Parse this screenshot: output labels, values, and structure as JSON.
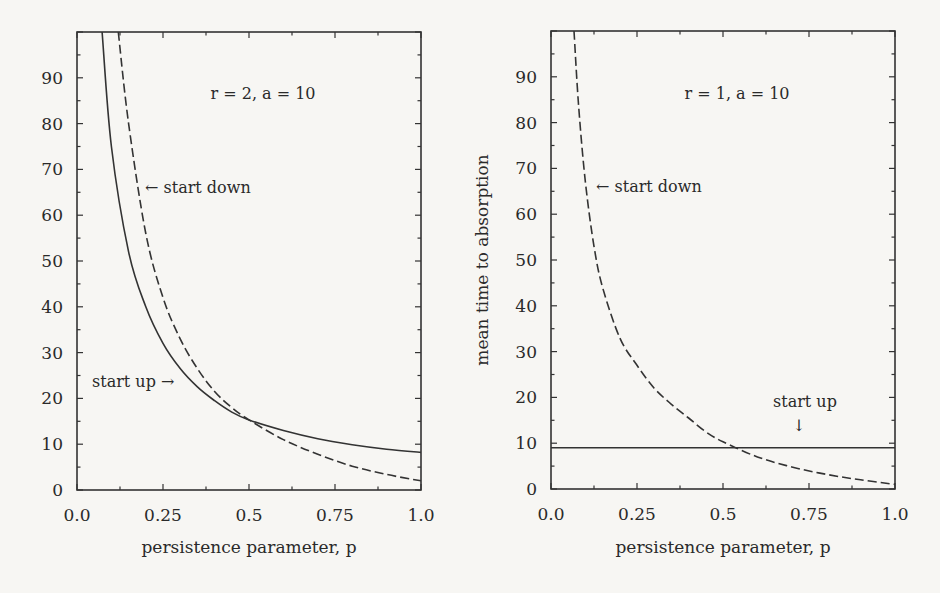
{
  "chart_data": [
    {
      "type": "line",
      "title": "r = 2, a = 10",
      "xlabel": "persistence parameter, p",
      "ylabel": "",
      "xlim": [
        0.0,
        1.0
      ],
      "ylim": [
        0,
        100
      ],
      "xticks": [
        "0.0",
        "0.25",
        "0.5",
        "0.75",
        "1.0"
      ],
      "yticks": [
        "0",
        "10",
        "20",
        "30",
        "40",
        "50",
        "60",
        "70",
        "80",
        "90"
      ],
      "grid": false,
      "legend": "none (inline annotations)",
      "annotations": [
        "← start down",
        "start up →"
      ],
      "series": [
        {
          "name": "start up",
          "style": "solid",
          "x": [
            0.073,
            0.1,
            0.15,
            0.2,
            0.25,
            0.3,
            0.35,
            0.4,
            0.45,
            0.5,
            0.6,
            0.7,
            0.8,
            0.9,
            1.0
          ],
          "values": [
            100,
            75,
            52,
            40,
            32,
            26.5,
            22.5,
            19.5,
            17,
            15.3,
            13,
            11.2,
            9.9,
            8.9,
            8.2
          ]
        },
        {
          "name": "start down",
          "style": "dashed",
          "x": [
            0.12,
            0.15,
            0.2,
            0.25,
            0.3,
            0.35,
            0.4,
            0.45,
            0.5,
            0.6,
            0.7,
            0.8,
            0.9,
            1.0
          ],
          "values": [
            100,
            80,
            56,
            42,
            33,
            26.5,
            21.5,
            18,
            15.3,
            11,
            7.8,
            5.2,
            3.4,
            2.0
          ]
        }
      ]
    },
    {
      "type": "line",
      "title": "r = 1, a = 10",
      "xlabel": "persistence parameter, p",
      "ylabel": "mean time to absorption",
      "xlim": [
        0.0,
        1.0
      ],
      "ylim": [
        0,
        100
      ],
      "xticks": [
        "0.0",
        "0.25",
        "0.5",
        "0.75",
        "1.0"
      ],
      "yticks": [
        "0",
        "10",
        "20",
        "30",
        "40",
        "50",
        "60",
        "70",
        "80",
        "90"
      ],
      "grid": false,
      "legend": "none (inline annotations)",
      "annotations": [
        "← start down",
        "start up ↓"
      ],
      "series": [
        {
          "name": "start up",
          "style": "solid",
          "x": [
            0.0,
            1.0
          ],
          "values": [
            9,
            9
          ]
        },
        {
          "name": "start down",
          "style": "dashed",
          "x": [
            0.067,
            0.08,
            0.1,
            0.125,
            0.15,
            0.2,
            0.25,
            0.3,
            0.35,
            0.4,
            0.45,
            0.5,
            0.6,
            0.7,
            0.8,
            0.9,
            1.0
          ],
          "values": [
            100,
            84,
            67,
            53,
            44,
            33,
            27,
            22,
            18.5,
            15.5,
            12.5,
            10.3,
            7,
            4.8,
            3.2,
            2.0,
            1.0
          ]
        }
      ]
    }
  ],
  "panels": {
    "left": {
      "param_label": "r = 2, a = 10",
      "annot_down": "← start down",
      "annot_up": "start up →",
      "xlabel": "persistence parameter, p"
    },
    "right": {
      "param_label": "r = 1, a = 10",
      "annot_down": "← start down",
      "annot_up": "start up",
      "annot_up_arrow": "↓",
      "xlabel": "persistence parameter, p",
      "ylabel": "mean time to absorption"
    }
  }
}
